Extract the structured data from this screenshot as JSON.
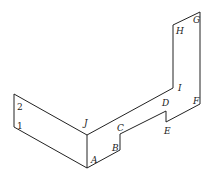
{
  "diagram": {
    "type": "isometric-outline",
    "vertex_labels": {
      "A": "A",
      "B": "B",
      "C": "C",
      "D": "D",
      "E": "E",
      "F": "F",
      "G": "G",
      "H": "H",
      "I": "I",
      "J": "J"
    },
    "side_labels": {
      "one": "1",
      "two": "2"
    },
    "stroke_color": "#222222",
    "background": "#ffffff"
  }
}
